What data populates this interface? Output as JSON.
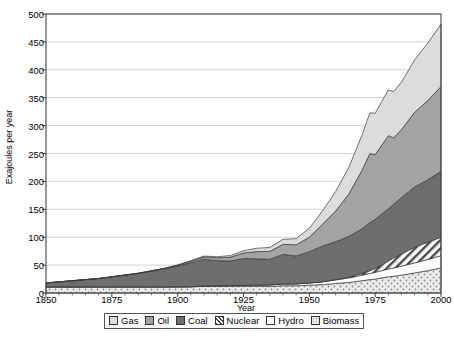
{
  "chart_data": {
    "type": "area",
    "stacked": true,
    "title": "",
    "xlabel": "Year",
    "ylabel": "Exajoules per year",
    "xlim": [
      1850,
      2000
    ],
    "ylim": [
      0,
      500
    ],
    "xticks": [
      1850,
      1875,
      1900,
      1925,
      1950,
      1975,
      2000
    ],
    "yticks": [
      0,
      50,
      100,
      150,
      200,
      250,
      300,
      350,
      400,
      450,
      500
    ],
    "grid": "horizontal",
    "legend_position": "bottom",
    "stack_order_bottom_to_top": [
      "Biomass",
      "Hydro",
      "Nuclear",
      "Coal",
      "Oil",
      "Gas"
    ],
    "x": [
      1850,
      1855,
      1860,
      1865,
      1870,
      1875,
      1880,
      1885,
      1890,
      1895,
      1900,
      1905,
      1910,
      1915,
      1920,
      1925,
      1930,
      1935,
      1940,
      1945,
      1950,
      1955,
      1960,
      1965,
      1970,
      1973,
      1975,
      1980,
      1982,
      1985,
      1990,
      1995,
      2000
    ],
    "series": [
      {
        "name": "Biomass",
        "color": "#e8e8e8",
        "pattern": "dots",
        "values": [
          11,
          11,
          11,
          11,
          11,
          11,
          11,
          11,
          11,
          11,
          11,
          11,
          12,
          12,
          12,
          12,
          12,
          12,
          13,
          13,
          14,
          15,
          17,
          19,
          22,
          24,
          25,
          29,
          30,
          32,
          36,
          40,
          45
        ]
      },
      {
        "name": "Hydro",
        "color": "#ffffff",
        "pattern": "solid",
        "values": [
          0,
          0,
          0,
          0,
          0,
          0,
          0,
          0,
          0,
          0,
          0.2,
          0.4,
          0.7,
          1,
          1.3,
          1.7,
          2.2,
          2.6,
          3.2,
          3.4,
          4,
          5,
          6.5,
          8,
          10,
          11,
          12,
          14,
          15,
          16,
          18,
          20,
          22
        ]
      },
      {
        "name": "Nuclear",
        "color": "#ffffff",
        "pattern": "hatch",
        "values": [
          0,
          0,
          0,
          0,
          0,
          0,
          0,
          0,
          0,
          0,
          0,
          0,
          0,
          0,
          0,
          0,
          0,
          0,
          0,
          0,
          0,
          0.1,
          0.5,
          1.2,
          3,
          5,
          7,
          14,
          18,
          22,
          28,
          31,
          33
        ]
      },
      {
        "name": "Coal",
        "color": "#6e6e6e",
        "pattern": "solid",
        "values": [
          7,
          9,
          11,
          13,
          15,
          18,
          21,
          24,
          28,
          32,
          37,
          43,
          48,
          45,
          44,
          48,
          47,
          46,
          53,
          50,
          56,
          64,
          68,
          73,
          80,
          86,
          88,
          94,
          96,
          101,
          108,
          112,
          118
        ]
      },
      {
        "name": "Oil",
        "color": "#a3a3a3",
        "pattern": "solid",
        "values": [
          0,
          0,
          0,
          0,
          0,
          0,
          0.2,
          0.4,
          0.7,
          1,
          1.5,
          2.5,
          4,
          5,
          7,
          10,
          13,
          14,
          18,
          20,
          26,
          39,
          55,
          76,
          105,
          124,
          116,
          131,
          119,
          122,
          134,
          142,
          152
        ]
      },
      {
        "name": "Gas",
        "color": "#dcdcdc",
        "pattern": "solid",
        "values": [
          0,
          0,
          0,
          0,
          0,
          0,
          0,
          0,
          0.2,
          0.4,
          0.7,
          1,
          1.5,
          2,
          3,
          4,
          6,
          7,
          9,
          11,
          16,
          24,
          35,
          48,
          63,
          73,
          74,
          82,
          83,
          85,
          94,
          103,
          112
        ]
      }
    ]
  },
  "legend": {
    "items": [
      {
        "label": "Gas",
        "swatch": "gas-swatch"
      },
      {
        "label": "Oil",
        "swatch": "oil-swatch"
      },
      {
        "label": "Coal",
        "swatch": "coal-swatch"
      },
      {
        "label": "Nuclear",
        "swatch": "nuclear-swatch"
      },
      {
        "label": "Hydro",
        "swatch": "hydro-swatch"
      },
      {
        "label": "Biomass",
        "swatch": "biomass-swatch"
      }
    ]
  },
  "colors": {
    "gas": "#dcdcdc",
    "oil": "#a3a3a3",
    "coal": "#6e6e6e",
    "nuclear": "#ffffff",
    "hydro": "#ffffff",
    "biomass": "#e8e8e8",
    "axis": "#444444",
    "grid": "#c8c8c8"
  }
}
